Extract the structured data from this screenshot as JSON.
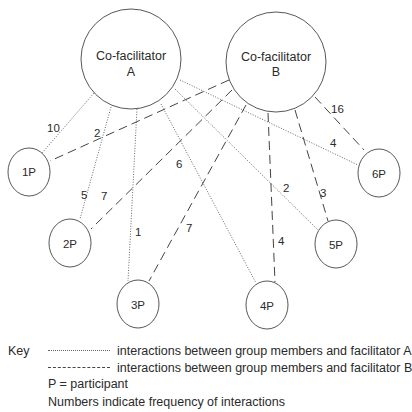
{
  "diagram": {
    "facilitators": [
      {
        "id": "A",
        "line1": "Co-facilitator",
        "line2": "A"
      },
      {
        "id": "B",
        "line1": "Co-facilitator",
        "line2": "B"
      }
    ],
    "participants": [
      {
        "id": "1P",
        "label": "1P"
      },
      {
        "id": "2P",
        "label": "2P"
      },
      {
        "id": "3P",
        "label": "3P"
      },
      {
        "id": "4P",
        "label": "4P"
      },
      {
        "id": "5P",
        "label": "5P"
      },
      {
        "id": "6P",
        "label": "6P"
      }
    ],
    "edges_facilitator_a": [
      {
        "to": "1P",
        "count": "10",
        "style": "dotted"
      },
      {
        "to": "2P",
        "count": "5",
        "style": "dotted"
      },
      {
        "to": "3P",
        "count": "1",
        "style": "dotted"
      },
      {
        "to": "4P",
        "count": "6",
        "style": "dotted"
      },
      {
        "to": "5P",
        "count": "2",
        "style": "dotted"
      },
      {
        "to": "6P",
        "count": "4",
        "style": "dotted"
      }
    ],
    "edges_facilitator_b": [
      {
        "to": "1P",
        "count": "2",
        "style": "dashed"
      },
      {
        "to": "2P",
        "count": "7",
        "style": "dashed"
      },
      {
        "to": "3P",
        "count": "7",
        "style": "dashed"
      },
      {
        "to": "4P",
        "count": "4",
        "style": "dashed"
      },
      {
        "to": "5P",
        "count": "3",
        "style": "dashed"
      },
      {
        "to": "6P",
        "count": "16",
        "style": "dashed"
      }
    ]
  },
  "legend": {
    "key_label": "Key",
    "dotted_desc": "interactions between group members and facilitator A",
    "dashed_desc": "interactions between group members and facilitator B",
    "participant_note": "P = participant",
    "numbers_note": "Numbers indicate frequency of interactions"
  }
}
